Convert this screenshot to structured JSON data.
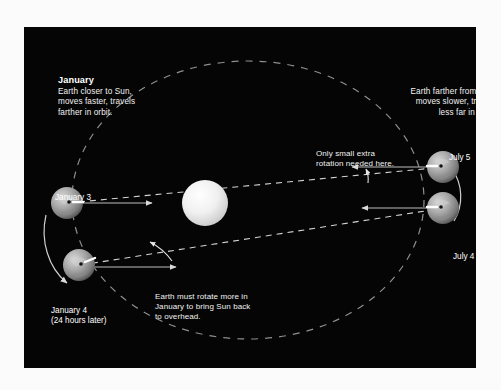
{
  "figure": {
    "background_color": "#050505",
    "page_color": "#fbfbfb",
    "topic": "Why a solar day is longer than a sidereal day",
    "captions": {
      "january": {
        "heading": "January",
        "body": "Earth closer to Sun,\nmoves faster, travels\nfarther in orbit."
      },
      "july": {
        "heading": "July",
        "body": "Earth farther from Sun,\nmoves slower, travels\nless far in orbit."
      }
    },
    "annotations": {
      "july_rotation": "Only small extra\nrotation needed here.",
      "january_rotation": "Earth must rotate more in\nJanuary to bring Sun back\nto overhead."
    },
    "bodies": [
      {
        "id": "sun",
        "label": "",
        "cx": 205,
        "cy": 203,
        "r": 23,
        "color": "#e8e8e8"
      },
      {
        "id": "january-3",
        "label": "January 3",
        "cx": 67,
        "cy": 203,
        "r": 16
      },
      {
        "id": "january-4",
        "label": "January 4\n(24 hours later)",
        "cx": 79,
        "cy": 262,
        "r": 16
      },
      {
        "id": "july-5",
        "label": "July 5",
        "cx": 443,
        "cy": 167,
        "r": 16
      },
      {
        "id": "july-4",
        "label": "July 4",
        "cx": 443,
        "cy": 208,
        "r": 16
      }
    ],
    "orbit": {
      "style": "dashed-ellipse",
      "cx": 248,
      "cy": 200,
      "rx": 200,
      "ry": 152,
      "color": "#8a8a8a"
    },
    "sight_lines": {
      "style": "dashed",
      "color": "#d8d8d8"
    },
    "motion_arrows": {
      "january_direction": "downward along orbit",
      "july_direction": "upward along orbit"
    }
  }
}
